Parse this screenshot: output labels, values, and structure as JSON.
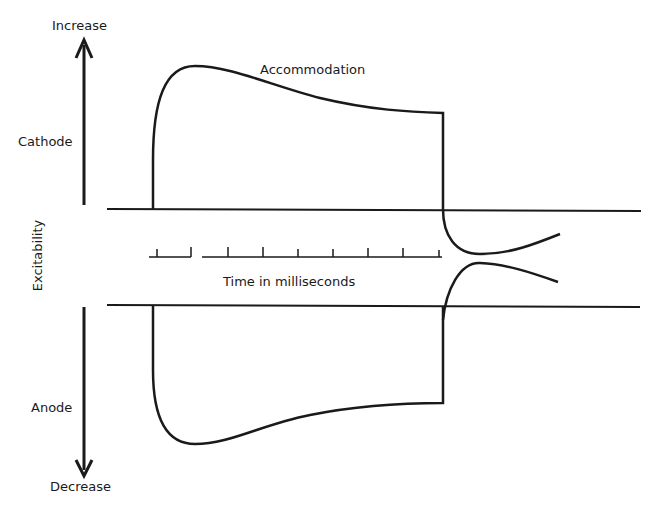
{
  "diagram": {
    "axis": {
      "top_label": "Increase",
      "bottom_label": "Decrease",
      "vertical_label": "Excitability",
      "upper_region_label": "Cathode",
      "lower_region_label": "Anode"
    },
    "curve_label": "Accommodation",
    "time_axis_label": "Time in milliseconds",
    "time_ticks": 9,
    "stroke_color": "#1a1a1a",
    "background": "#ffffff"
  }
}
